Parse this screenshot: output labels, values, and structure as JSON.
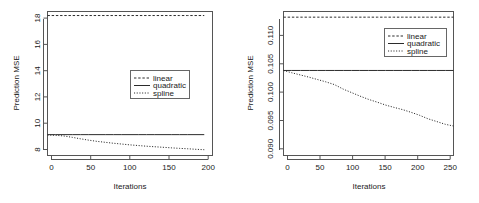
{
  "figure": {
    "title": "",
    "background": "#ffffff",
    "line_color": "#2b2b2b"
  },
  "chart_data": [
    {
      "id": "left-panel",
      "type": "line",
      "title": "",
      "xlabel": "Iterations",
      "ylabel": "Prediction MSE",
      "xlim": [
        0,
        200
      ],
      "ylim": [
        7.9,
        18.6
      ],
      "xticks": [
        0,
        50,
        100,
        150,
        200
      ],
      "xtick_labels": [
        "0",
        "50",
        "100",
        "150",
        "200"
      ],
      "yticks": [
        8,
        10,
        12,
        14,
        16,
        18
      ],
      "ytick_labels": [
        "8",
        "10",
        "12",
        "14",
        "16",
        "18"
      ],
      "grid": false,
      "legend_position": "center",
      "legend_entries": [
        "linear",
        "quadratic",
        "spline"
      ],
      "x": [
        0,
        10,
        20,
        30,
        40,
        50,
        60,
        70,
        80,
        90,
        100,
        110,
        120,
        130,
        140,
        150,
        160,
        170,
        180,
        190
      ],
      "series": [
        {
          "name": "linear",
          "style": "dashed",
          "values": [
            18.3,
            18.3,
            18.3,
            18.3,
            18.3,
            18.3,
            18.3,
            18.3,
            18.3,
            18.3,
            18.3,
            18.3,
            18.3,
            18.3,
            18.3,
            18.3,
            18.3,
            18.3,
            18.3,
            18.3
          ]
        },
        {
          "name": "quadratic",
          "style": "solid",
          "values": [
            9.45,
            9.45,
            9.45,
            9.45,
            9.45,
            9.45,
            9.45,
            9.45,
            9.45,
            9.45,
            9.45,
            9.45,
            9.45,
            9.45,
            9.45,
            9.45,
            9.45,
            9.45,
            9.45,
            9.45
          ]
        },
        {
          "name": "spline",
          "style": "dotted",
          "values": [
            9.42,
            9.4,
            9.35,
            9.25,
            9.14,
            9.04,
            8.95,
            8.88,
            8.81,
            8.75,
            8.69,
            8.64,
            8.59,
            8.55,
            8.51,
            8.47,
            8.43,
            8.4,
            8.36,
            8.33
          ]
        }
      ]
    },
    {
      "id": "right-panel",
      "type": "line",
      "title": "",
      "xlabel": "Iterations",
      "ylabel": "Prediction MSE",
      "xlim": [
        0,
        250
      ],
      "ylim": [
        0.0888,
        0.1142
      ],
      "xticks": [
        0,
        50,
        100,
        150,
        200,
        250
      ],
      "xtick_labels": [
        "0",
        "50",
        "100",
        "150",
        "200",
        "250"
      ],
      "yticks": [
        0.09,
        0.095,
        0.1,
        0.105,
        0.11
      ],
      "ytick_labels": [
        "0.090",
        "0.095",
        "0.100",
        "0.105",
        "0.110"
      ],
      "grid": false,
      "legend_position": "upper right",
      "legend_entries": [
        "linear",
        "quadratic",
        "spline"
      ],
      "x": [
        0,
        12,
        25,
        38,
        50,
        62,
        75,
        88,
        100,
        112,
        125,
        138,
        150,
        162,
        175,
        188,
        200,
        212,
        225,
        238,
        250
      ],
      "series": [
        {
          "name": "linear",
          "style": "dashed",
          "values": [
            0.1132,
            0.1132,
            0.1132,
            0.1132,
            0.1132,
            0.1132,
            0.1132,
            0.1132,
            0.1132,
            0.1132,
            0.1132,
            0.1132,
            0.1132,
            0.1132,
            0.1132,
            0.1132,
            0.1132,
            0.1132,
            0.1132,
            0.1132,
            0.1132
          ]
        },
        {
          "name": "quadratic",
          "style": "solid",
          "values": [
            0.1038,
            0.1038,
            0.1038,
            0.1038,
            0.1038,
            0.1038,
            0.1038,
            0.1038,
            0.1038,
            0.1038,
            0.1038,
            0.1038,
            0.1038,
            0.1038,
            0.1038,
            0.1038,
            0.1038,
            0.1038,
            0.1038,
            0.1038,
            0.1038
          ]
        },
        {
          "name": "spline",
          "style": "dotted",
          "values": [
            0.1038,
            0.1034,
            0.103,
            0.1026,
            0.1022,
            0.1018,
            0.1013,
            0.1005,
            0.0999,
            0.0993,
            0.0987,
            0.0982,
            0.0977,
            0.0973,
            0.0969,
            0.0964,
            0.0959,
            0.0953,
            0.0948,
            0.0943,
            0.094
          ]
        }
      ]
    }
  ]
}
